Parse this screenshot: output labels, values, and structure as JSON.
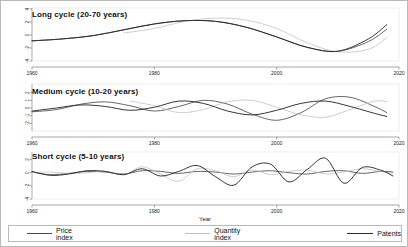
{
  "figure": {
    "xlabel": "Year",
    "panels": [
      {
        "id": "long",
        "title": "Long cycle (20-70 years)"
      },
      {
        "id": "medium",
        "title": "Medium cycle (10-20 years)"
      },
      {
        "id": "short",
        "title": "Short cycle (5-10 years)"
      }
    ]
  },
  "legend": {
    "items": [
      {
        "label": "Price index",
        "color": "#4a4a4a"
      },
      {
        "label": "Quantity index",
        "color": "#bdbdbd"
      },
      {
        "label": "Patents",
        "color": "#2b2b2b"
      }
    ]
  },
  "chart_data": {
    "type": "line",
    "title": "",
    "xlabel": "Year",
    "ylabel": "",
    "xlim": [
      1960,
      2020
    ],
    "xticks": [
      1960,
      1980,
      2000,
      2020
    ],
    "xticklabels": [
      "1960",
      "1980",
      "2000",
      "2020"
    ],
    "grid": false,
    "legend_position": "bottom",
    "colors": {
      "price_index": "#4a4a4a",
      "quantity_index": "#bdbdbd",
      "patents": "#2b2b2b"
    },
    "panels": [
      {
        "name": "Long cycle (20-70 years)",
        "ylim": [
          -4,
          4
        ],
        "yticks": [
          -4,
          -2,
          0,
          2,
          4
        ],
        "yticklabels": [
          "-4",
          "-2",
          "0",
          "2",
          "4"
        ],
        "x": [
          1960,
          1965,
          1970,
          1975,
          1980,
          1985,
          1990,
          1995,
          2000,
          2005,
          2010,
          2015,
          2018
        ],
        "series": [
          {
            "name": "Price index",
            "values": [
              -0.9,
              -0.6,
              -0.1,
              0.8,
              1.7,
              2.2,
              2.1,
              1.2,
              -0.3,
              -1.9,
              -2.5,
              -1.0,
              0.9
            ]
          },
          {
            "name": "Quantity index",
            "values": [
              null,
              null,
              null,
              0.3,
              1.0,
              2.1,
              2.6,
              2.3,
              1.0,
              -1.2,
              -2.6,
              -2.2,
              -0.4
            ]
          },
          {
            "name": "Patents",
            "values": [
              -0.9,
              -0.6,
              -0.1,
              0.8,
              1.7,
              2.2,
              2.1,
              1.2,
              -0.3,
              -1.9,
              -2.5,
              -0.6,
              1.6
            ]
          }
        ]
      },
      {
        "name": "Medium cycle (10-20 years)",
        "ylim": [
          -3,
          3
        ],
        "yticks": [
          -2,
          -1,
          0,
          1,
          2
        ],
        "yticklabels": [
          "-2",
          "-1",
          "0",
          "1",
          "2"
        ],
        "x": [
          1960,
          1964,
          1968,
          1972,
          1976,
          1980,
          1984,
          1988,
          1992,
          1996,
          2000,
          2004,
          2008,
          2012,
          2016,
          2018
        ],
        "series": [
          {
            "name": "Price index",
            "values": [
              -0.5,
              -0.2,
              0.5,
              0.8,
              0.3,
              -0.4,
              0.2,
              1.0,
              0.5,
              -0.8,
              -1.6,
              -0.6,
              1.2,
              1.4,
              0.2,
              -0.6
            ]
          },
          {
            "name": "Quantity index",
            "values": [
              null,
              null,
              null,
              null,
              0.9,
              0.3,
              -0.6,
              -0.2,
              0.8,
              1.0,
              0.1,
              -0.9,
              -1.2,
              -0.2,
              0.9,
              0.8
            ]
          },
          {
            "name": "Patents",
            "values": [
              -0.4,
              0.0,
              0.4,
              0.2,
              -0.3,
              0.1,
              0.9,
              0.6,
              -0.4,
              -0.9,
              -0.3,
              0.6,
              0.9,
              0.2,
              -0.7,
              -1.1
            ]
          }
        ]
      },
      {
        "name": "Short cycle (5-10 years)",
        "ylim": [
          -4,
          3
        ],
        "yticks": [
          -4,
          -2,
          0,
          2
        ],
        "yticklabels": [
          "-4",
          "-2",
          "0",
          "2"
        ],
        "x": [
          1960,
          1963,
          1966,
          1969,
          1972,
          1975,
          1978,
          1981,
          1984,
          1987,
          1990,
          1993,
          1996,
          1999,
          2002,
          2005,
          2008,
          2011,
          2014,
          2017,
          2019
        ],
        "series": [
          {
            "name": "Price index",
            "values": [
              0.1,
              -0.3,
              -0.1,
              0.2,
              0.1,
              -0.2,
              0.3,
              0.2,
              -0.1,
              0.2,
              0.1,
              -0.2,
              0.1,
              0.3,
              0.0,
              -0.2,
              0.2,
              0.3,
              -0.1,
              0.2,
              0.1
            ]
          },
          {
            "name": "Quantity index",
            "values": [
              0.0,
              0.1,
              -0.1,
              0.0,
              0.2,
              -0.3,
              0.9,
              -0.2,
              -1.3,
              0.6,
              0.3,
              -0.6,
              0.4,
              -0.3,
              0.2,
              0.4,
              -0.2,
              0.1,
              0.6,
              0.2,
              -0.1
            ]
          },
          {
            "name": "Patents",
            "values": [
              0.2,
              -0.4,
              -0.2,
              0.3,
              0.2,
              -0.3,
              0.6,
              -0.5,
              0.2,
              1.1,
              -0.6,
              -1.9,
              0.9,
              1.3,
              -1.4,
              0.5,
              2.2,
              -1.6,
              0.8,
              0.4,
              -0.5
            ]
          }
        ]
      }
    ]
  }
}
